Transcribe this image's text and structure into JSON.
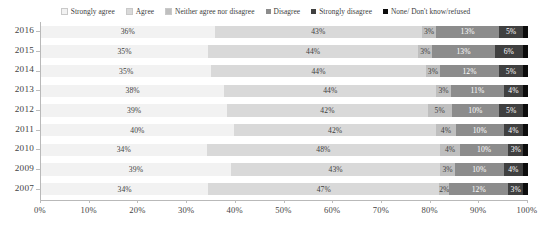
{
  "chart_data": {
    "type": "bar",
    "orientation": "horizontal",
    "stacked": true,
    "normalized": "percent",
    "title": "",
    "subtitle": "",
    "xlabel": "",
    "ylabel": "",
    "xlim": [
      0,
      100
    ],
    "grid": false,
    "legend_position": "top",
    "categories": [
      "2016",
      "2015",
      "2014",
      "2013",
      "2012",
      "2011",
      "2010",
      "2009",
      "2007"
    ],
    "xtick_labels": [
      "0%",
      "10%",
      "20%",
      "30%",
      "40%",
      "50%",
      "60%",
      "70%",
      "80%",
      "90%",
      "100%"
    ],
    "xtick_values": [
      0,
      10,
      20,
      30,
      40,
      50,
      60,
      70,
      80,
      90,
      100
    ],
    "series": [
      {
        "name": "Strongly agree",
        "color": "#f2f2f2",
        "label_color": "#404040",
        "values": [
          36,
          35,
          35,
          38,
          39,
          40,
          34,
          39,
          34
        ],
        "value_labels": [
          "36%",
          "35%",
          "35%",
          "38%",
          "39%",
          "40%",
          "34%",
          "39%",
          "34%"
        ]
      },
      {
        "name": "Agree",
        "color": "#d9d9d9",
        "label_color": "#404040",
        "values": [
          43,
          44,
          44,
          44,
          42,
          42,
          48,
          43,
          47
        ],
        "value_labels": [
          "43%",
          "44%",
          "44%",
          "44%",
          "42%",
          "42%",
          "48%",
          "43%",
          "47%"
        ]
      },
      {
        "name": "Neither agree nor disagree",
        "color": "#bfbfbf",
        "label_color": "#404040",
        "values": [
          3,
          3,
          3,
          3,
          5,
          4,
          4,
          3,
          2
        ],
        "value_labels": [
          "3%",
          "3%",
          "3%",
          "3%",
          "5%",
          "4%",
          "4%",
          "3%",
          "2%"
        ]
      },
      {
        "name": "Disagree",
        "color": "#8c8c8c",
        "label_color": "#ffffff",
        "values": [
          13,
          13,
          12,
          11,
          10,
          10,
          10,
          10,
          12
        ],
        "value_labels": [
          "13%",
          "13%",
          "12%",
          "11%",
          "10%",
          "10%",
          "10%",
          "10%",
          "12%"
        ]
      },
      {
        "name": "Strongly disagree",
        "color": "#404040",
        "label_color": "#ffffff",
        "values": [
          5,
          6,
          5,
          4,
          5,
          4,
          3,
          4,
          3
        ],
        "value_labels": [
          "5%",
          "6%",
          "5%",
          "4%",
          "5%",
          "4%",
          "3%",
          "4%",
          "3%"
        ]
      },
      {
        "name": "None/ Don't know/refused",
        "color": "#0d0d0d",
        "label_color": "#ffffff",
        "values": [
          1,
          1,
          1,
          1,
          1,
          1,
          1,
          1,
          1
        ],
        "value_labels": [
          "",
          "",
          "",
          "",
          "",
          "",
          "",
          "",
          ""
        ]
      }
    ]
  },
  "legend": {
    "items": [
      {
        "label": "Strongly agree",
        "color": "#f2f2f2"
      },
      {
        "label": "Agree",
        "color": "#d9d9d9"
      },
      {
        "label": "Neither agree nor disagree",
        "color": "#bfbfbf"
      },
      {
        "label": "Disagree",
        "color": "#8c8c8c"
      },
      {
        "label": "Strongly disagree",
        "color": "#404040"
      },
      {
        "label": "None/ Don't know/refused",
        "color": "#0d0d0d"
      }
    ]
  }
}
